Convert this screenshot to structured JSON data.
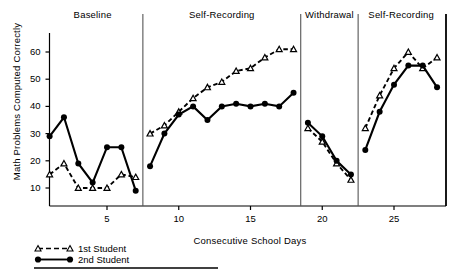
{
  "chart_data": {
    "type": "line",
    "title": "",
    "xlabel": "Consecutive School Days",
    "ylabel": "Math Problems Computed Correctly",
    "xlim": [
      0.2,
      28.8
    ],
    "ylim": [
      3,
      66
    ],
    "grid": false,
    "legend_position": "bottom-left",
    "xticks": [
      5,
      10,
      15,
      20,
      25
    ],
    "yticks": [
      10,
      20,
      30,
      40,
      50,
      60
    ],
    "x": [
      1,
      2,
      3,
      4,
      5,
      6,
      7,
      8,
      9,
      10,
      11,
      12,
      13,
      14,
      15,
      16,
      17,
      18,
      19,
      20,
      21,
      22,
      23,
      24,
      25,
      26,
      27,
      28
    ],
    "phases": [
      {
        "label": "Baseline",
        "start": 1,
        "end": 7
      },
      {
        "label": "Self-Recording",
        "start": 8,
        "end": 18
      },
      {
        "label": "Withdrawal",
        "start": 19,
        "end": 22
      },
      {
        "label": "Self-Recording",
        "start": 23,
        "end": 28
      }
    ],
    "series": [
      {
        "name": "1st Student",
        "marker": "open-triangle",
        "line": "dashed",
        "color": "#000000",
        "points": [
          {
            "x": 1,
            "y": 15
          },
          {
            "x": 2,
            "y": 19
          },
          {
            "x": 3,
            "y": 10
          },
          {
            "x": 4,
            "y": 10
          },
          {
            "x": 5,
            "y": 10
          },
          {
            "x": 6,
            "y": 15
          },
          {
            "x": 7,
            "y": 14
          },
          {
            "x": 8,
            "y": 30
          },
          {
            "x": 9,
            "y": 33
          },
          {
            "x": 10,
            "y": 38
          },
          {
            "x": 11,
            "y": 43
          },
          {
            "x": 12,
            "y": 47
          },
          {
            "x": 13,
            "y": 49
          },
          {
            "x": 14,
            "y": 53
          },
          {
            "x": 15,
            "y": 54
          },
          {
            "x": 16,
            "y": 58
          },
          {
            "x": 17,
            "y": 61
          },
          {
            "x": 18,
            "y": 61
          },
          {
            "x": 19,
            "y": 32
          },
          {
            "x": 20,
            "y": 27
          },
          {
            "x": 21,
            "y": 19
          },
          {
            "x": 22,
            "y": 13
          },
          {
            "x": 23,
            "y": 32
          },
          {
            "x": 24,
            "y": 44
          },
          {
            "x": 25,
            "y": 54
          },
          {
            "x": 26,
            "y": 60
          },
          {
            "x": 27,
            "y": 54
          },
          {
            "x": 28,
            "y": 58
          }
        ]
      },
      {
        "name": "2nd Student",
        "marker": "filled-circle",
        "line": "solid",
        "color": "#000000",
        "points": [
          {
            "x": 1,
            "y": 29
          },
          {
            "x": 2,
            "y": 36
          },
          {
            "x": 3,
            "y": 19
          },
          {
            "x": 4,
            "y": 12
          },
          {
            "x": 5,
            "y": 25
          },
          {
            "x": 6,
            "y": 25
          },
          {
            "x": 7,
            "y": 9
          },
          {
            "x": 8,
            "y": 18
          },
          {
            "x": 9,
            "y": 30
          },
          {
            "x": 10,
            "y": 37
          },
          {
            "x": 11,
            "y": 40
          },
          {
            "x": 12,
            "y": 35
          },
          {
            "x": 13,
            "y": 40
          },
          {
            "x": 14,
            "y": 41
          },
          {
            "x": 15,
            "y": 40
          },
          {
            "x": 16,
            "y": 41
          },
          {
            "x": 17,
            "y": 40
          },
          {
            "x": 18,
            "y": 45
          },
          {
            "x": 19,
            "y": 34
          },
          {
            "x": 20,
            "y": 29
          },
          {
            "x": 21,
            "y": 20
          },
          {
            "x": 22,
            "y": 15
          },
          {
            "x": 23,
            "y": 24
          },
          {
            "x": 24,
            "y": 38
          },
          {
            "x": 25,
            "y": 48
          },
          {
            "x": 26,
            "y": 55
          },
          {
            "x": 27,
            "y": 55
          },
          {
            "x": 28,
            "y": 47
          }
        ]
      }
    ]
  },
  "legend": {
    "items": [
      {
        "label": "1st Student"
      },
      {
        "label": "2nd Student"
      }
    ]
  }
}
